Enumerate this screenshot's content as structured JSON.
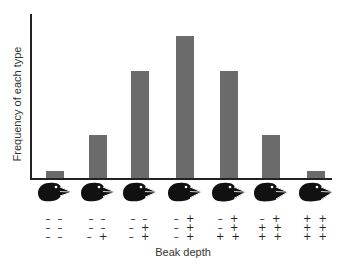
{
  "chart_data": {
    "type": "bar",
    "title": "",
    "xlabel": "Beak depth",
    "ylabel": "Frequency of each type",
    "categories": [
      "– – / – – / – –",
      "– – / – – / – +",
      "– – / – + / – +",
      "– + / – + / – +",
      "– + / – + / + +",
      "– + / + + / + +",
      "+ + / + + / + +"
    ],
    "genotypes": [
      [
        [
          "–",
          "–"
        ],
        [
          "–",
          "–"
        ],
        [
          "–",
          "–"
        ]
      ],
      [
        [
          "–",
          "–"
        ],
        [
          "–",
          "–"
        ],
        [
          "–",
          "+"
        ]
      ],
      [
        [
          "–",
          "–"
        ],
        [
          "–",
          "+"
        ],
        [
          "–",
          "+"
        ]
      ],
      [
        [
          "–",
          "+"
        ],
        [
          "–",
          "+"
        ],
        [
          "–",
          "+"
        ]
      ],
      [
        [
          "–",
          "+"
        ],
        [
          "–",
          "+"
        ],
        [
          "+",
          "+"
        ]
      ],
      [
        [
          "–",
          "+"
        ],
        [
          "+",
          "+"
        ],
        [
          "+",
          "+"
        ]
      ],
      [
        [
          "+",
          "+"
        ],
        [
          "+",
          "+"
        ],
        [
          "+",
          "+"
        ]
      ]
    ],
    "values": [
      1,
      6,
      15,
      20,
      15,
      6,
      1
    ],
    "ylim": [
      0,
      23
    ],
    "grid": false,
    "legend": null,
    "tick_labels_y": [],
    "bar_color": "#6b6b6b",
    "x_tick_icons": "finch-head-icon (increasing beak depth)"
  },
  "labels": {
    "y": "Frequency of each type",
    "x": "Beak depth"
  },
  "rows": [
    [
      "– –",
      "– –",
      "– –"
    ],
    [
      "– –",
      "– –",
      "– +"
    ],
    [
      "– –",
      "– +",
      "– +"
    ],
    [
      "– +",
      "– +",
      "– +"
    ],
    [
      "– +",
      "– +",
      "+ +"
    ],
    [
      "– +",
      "+ +",
      "+ +"
    ],
    [
      "+ +",
      "+ +",
      "+ +"
    ]
  ]
}
